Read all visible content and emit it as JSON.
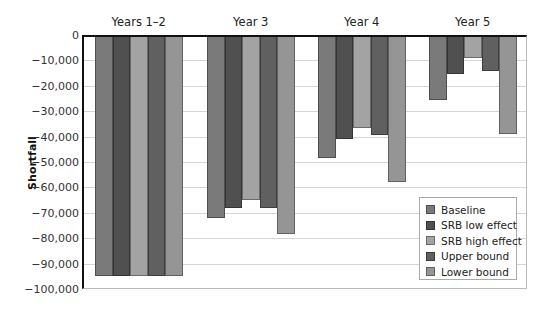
{
  "chart_data": {
    "type": "bar",
    "title": "",
    "xlabel": "",
    "ylabel": "Shortfall",
    "ylim": [
      -100000,
      0
    ],
    "yticks": [
      0,
      -10000,
      -20000,
      -30000,
      -40000,
      -50000,
      -60000,
      -70000,
      -80000,
      -90000,
      -100000
    ],
    "ytick_labels": [
      "0",
      "−10,000",
      "−20,000",
      "−30,000",
      "−40,000",
      "−50,000",
      "−60,000",
      "−70,000",
      "−80,000",
      "−90,000",
      "−100,000"
    ],
    "grid": true,
    "legend_position": "lower right (inside)",
    "categories": [
      "Years 1–2",
      "Year 3",
      "Year 4",
      "Year 5"
    ],
    "series": [
      {
        "name": "Baseline",
        "color": "#7a7a7a",
        "values": [
          -95000,
          -72000,
          -48500,
          -25500
        ]
      },
      {
        "name": "SRB low effect",
        "color": "#505050",
        "values": [
          -95000,
          -68000,
          -41000,
          -15500
        ]
      },
      {
        "name": "SRB high effect",
        "color": "#a3a3a3",
        "values": [
          -95000,
          -65000,
          -36500,
          -9000
        ]
      },
      {
        "name": "Upper bound",
        "color": "#606060",
        "values": [
          -95000,
          -68000,
          -39500,
          -14000
        ]
      },
      {
        "name": "Lower bound",
        "color": "#959595",
        "values": [
          -95000,
          -78500,
          -58000,
          -39000
        ]
      }
    ]
  }
}
